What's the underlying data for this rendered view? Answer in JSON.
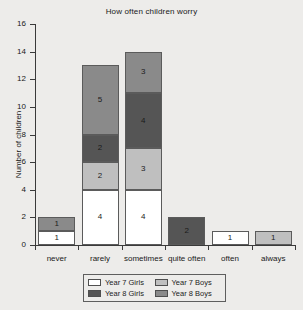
{
  "chart_data": {
    "type": "bar",
    "subtype": "stacked-bar",
    "title": "How often children worry",
    "xlabel": "",
    "ylabel": "Number of children",
    "ylim": [
      0,
      16
    ],
    "ytick_step": 2,
    "yticks": [
      0,
      2,
      4,
      6,
      8,
      10,
      12,
      14,
      16
    ],
    "grid": false,
    "legend_position": "bottom",
    "categories": [
      "never",
      "rarely",
      "sometimes",
      "quite often",
      "often",
      "always"
    ],
    "series": [
      {
        "name": "Year 7 Girls",
        "color": "#ffffff",
        "values": [
          1,
          4,
          4,
          0,
          1,
          0
        ]
      },
      {
        "name": "Year 7 Boys",
        "color": "#bfbfbf",
        "values": [
          0,
          2,
          3,
          0,
          0,
          1
        ]
      },
      {
        "name": "Year 8 Girls",
        "color": "#555555",
        "values": [
          0,
          2,
          4,
          2,
          0,
          0
        ]
      },
      {
        "name": "Year 8 Boys",
        "color": "#8a8a8a",
        "values": [
          1,
          5,
          3,
          0,
          0,
          0
        ]
      }
    ],
    "totals": [
      2,
      13,
      14,
      2,
      1,
      1
    ]
  },
  "legend": {
    "entries": [
      {
        "label": "Year 7 Girls",
        "color": "#ffffff"
      },
      {
        "label": "Year 7 Boys",
        "color": "#bfbfbf"
      },
      {
        "label": "Year 8 Girls",
        "color": "#555555"
      },
      {
        "label": "Year 8 Boys",
        "color": "#8a8a8a"
      }
    ]
  },
  "colors": {
    "background": "#edecea",
    "axis": "#3a3a3a",
    "bar_outline": "#5b5b5b",
    "text": "#202020"
  }
}
